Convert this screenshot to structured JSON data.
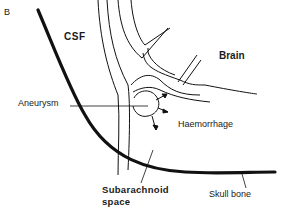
{
  "figure": {
    "panel_letter": "B",
    "labels": {
      "csf": "CSF",
      "brain": "Brain",
      "aneurysm": "Aneurysm",
      "haemorrhage": "Haemorrhage",
      "subarachnoid_line1": "Subarachnoid",
      "subarachnoid_line2": "space",
      "skull_bone": "Skull bone"
    },
    "colors": {
      "ink": "#1a1a1a",
      "background": "#ffffff"
    }
  }
}
